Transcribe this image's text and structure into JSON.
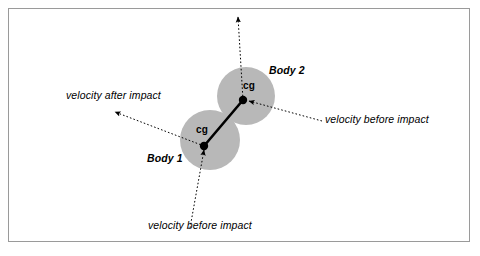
{
  "figure": {
    "kind": "physics-collision-diagram",
    "background_color": "#ffffff",
    "border_color": "#9a9a9a",
    "body_fill_color": "#b8b8b8",
    "line_color": "#000000"
  },
  "labels": {
    "velocity_after_impact": "velocity after impact",
    "velocity_before_impact_right": "velocity before impact",
    "velocity_before_impact_bottom": "velocity before impact",
    "body_1": "Body 1",
    "body_2": "Body 2",
    "cg_1": "cg",
    "cg_2": "cg"
  },
  "bodies": [
    {
      "name": "Body 1",
      "cx": 210,
      "cy": 140,
      "r": 30,
      "cg_x": 204,
      "cg_y": 146
    },
    {
      "name": "Body 2",
      "cx": 246,
      "cy": 96,
      "r": 29,
      "cg_x": 243,
      "cg_y": 100
    }
  ],
  "vectors": [
    {
      "name": "velocity after impact",
      "from_x": 204,
      "from_y": 146,
      "to_x": 115,
      "to_y": 112,
      "style": "dotted",
      "arrow_at": "to"
    },
    {
      "name": "velocity before impact bottom",
      "from_x": 190,
      "from_y": 228,
      "to_x": 204,
      "to_y": 146,
      "style": "dotted",
      "arrow_at": "to"
    },
    {
      "name": "velocity before impact right",
      "from_x": 322,
      "from_y": 121,
      "to_x": 243,
      "to_y": 100,
      "style": "dotted",
      "arrow_at": "to"
    },
    {
      "name": "velocity after impact body 2",
      "from_x": 243,
      "from_y": 100,
      "to_x": 238,
      "to_y": 17,
      "style": "dotted",
      "arrow_at": "to"
    },
    {
      "name": "line of impact",
      "from_x": 204,
      "from_y": 146,
      "to_x": 243,
      "to_y": 100,
      "style": "solid",
      "arrow_at": "none"
    }
  ]
}
